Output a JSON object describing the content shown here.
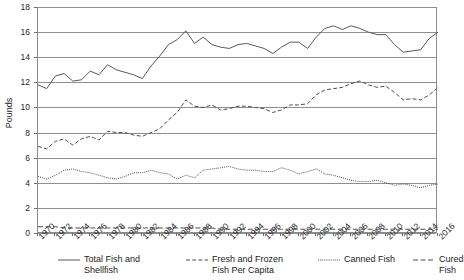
{
  "chart_data": {
    "type": "line",
    "title": "",
    "subtitle": "",
    "xlabel": "",
    "ylabel": "Pounds",
    "ylim": [
      0,
      18
    ],
    "ytick_step": 2,
    "yticks": [
      18,
      16,
      14,
      12,
      10,
      8,
      6,
      4,
      2,
      0
    ],
    "grid": true,
    "legend_position": "bottom",
    "xlim": [
      1970,
      2016
    ],
    "x": [
      1970,
      1971,
      1972,
      1973,
      1974,
      1975,
      1976,
      1977,
      1978,
      1979,
      1980,
      1981,
      1982,
      1983,
      1984,
      1985,
      1986,
      1987,
      1988,
      1989,
      1990,
      1991,
      1992,
      1993,
      1994,
      1995,
      1996,
      1997,
      1998,
      1999,
      2000,
      2001,
      2002,
      2003,
      2004,
      2005,
      2006,
      2007,
      2008,
      2009,
      2010,
      2011,
      2012,
      2013,
      2014,
      2015,
      2016
    ],
    "xticks": [
      1970,
      1972,
      1974,
      1976,
      1978,
      1980,
      1982,
      1984,
      1986,
      1988,
      1990,
      1992,
      1994,
      1996,
      1998,
      2000,
      2002,
      2004,
      2006,
      2008,
      2010,
      2012,
      2014,
      2016
    ],
    "xticklabels": [
      "1970",
      "1972",
      "1974",
      "1976",
      "1978",
      "1980",
      "1982",
      "1984",
      "1986",
      "1988",
      "1990",
      "1992",
      "1994",
      "1996",
      "1998",
      "2000",
      "2002",
      "2004",
      "2006",
      "2008",
      "2010",
      "2012",
      "2014",
      "2016"
    ],
    "series": [
      {
        "name": "Total Fish and Shellfish",
        "legend_label": "Total Fish and\nShellfish",
        "style": "solid",
        "color": "#595959",
        "values": [
          11.8,
          11.5,
          12.5,
          12.7,
          12.1,
          12.2,
          12.9,
          12.6,
          13.4,
          13.0,
          12.8,
          12.6,
          12.3,
          13.3,
          14.1,
          15.0,
          15.4,
          16.1,
          15.1,
          15.6,
          15.0,
          14.8,
          14.7,
          15.0,
          15.1,
          14.9,
          14.7,
          14.3,
          14.8,
          15.2,
          15.2,
          14.7,
          15.6,
          16.3,
          16.5,
          16.2,
          16.5,
          16.3,
          16.0,
          15.8,
          15.8,
          15.0,
          14.4,
          14.5,
          14.6,
          15.5,
          16.0
        ]
      },
      {
        "name": "Fresh and Frozen Fish Per Capita",
        "legend_label": "Fresh and Frozen\nFish Per Capita",
        "style": "dashed",
        "color": "#4d4d4d",
        "values": [
          6.9,
          6.7,
          7.3,
          7.5,
          7.0,
          7.5,
          7.7,
          7.4,
          8.1,
          8.0,
          8.0,
          7.8,
          7.7,
          8.0,
          8.3,
          9.0,
          9.6,
          10.6,
          10.1,
          10.0,
          10.2,
          9.8,
          9.9,
          10.1,
          10.1,
          10.0,
          9.9,
          9.6,
          9.8,
          10.2,
          10.2,
          10.3,
          11.0,
          11.4,
          11.5,
          11.6,
          11.9,
          12.1,
          11.8,
          11.6,
          11.7,
          11.2,
          10.6,
          10.7,
          10.6,
          11.0,
          11.6
        ]
      },
      {
        "name": "Canned Fish",
        "legend_label": "Canned Fish",
        "style": "dotted",
        "color": "#4d4d4d",
        "values": [
          4.5,
          4.3,
          4.6,
          5.0,
          5.1,
          4.9,
          4.8,
          4.6,
          4.4,
          4.3,
          4.5,
          4.8,
          4.8,
          5.0,
          4.8,
          4.7,
          4.3,
          4.6,
          4.4,
          5.0,
          5.1,
          5.2,
          5.3,
          5.1,
          5.0,
          5.0,
          4.9,
          4.9,
          5.2,
          5.0,
          4.7,
          4.9,
          5.1,
          4.7,
          4.6,
          4.4,
          4.2,
          4.1,
          4.1,
          4.2,
          4.0,
          3.8,
          3.9,
          3.8,
          3.6,
          3.8,
          3.9
        ]
      },
      {
        "name": "Cured Fish",
        "legend_label": "Cured Fish",
        "style": "dashed-long",
        "color": "#4d4d4d",
        "values": [
          0.5,
          0.5,
          0.5,
          0.4,
          0.4,
          0.4,
          0.4,
          0.4,
          0.4,
          0.4,
          0.4,
          0.4,
          0.4,
          0.4,
          0.4,
          0.4,
          0.4,
          0.4,
          0.4,
          0.4,
          0.4,
          0.3,
          0.3,
          0.3,
          0.3,
          0.3,
          0.3,
          0.3,
          0.3,
          0.3,
          0.3,
          0.3,
          0.3,
          0.3,
          0.3,
          0.3,
          0.3,
          0.3,
          0.3,
          0.3,
          0.3,
          0.3,
          0.3,
          0.3,
          0.3,
          0.3,
          0.3
        ]
      }
    ]
  },
  "axis": {
    "y_title": "Pounds"
  },
  "colors": {
    "grid": "#8f8f8f",
    "axis": "#8c8c8c",
    "text": "#262626",
    "line": "#4d4d4d"
  }
}
